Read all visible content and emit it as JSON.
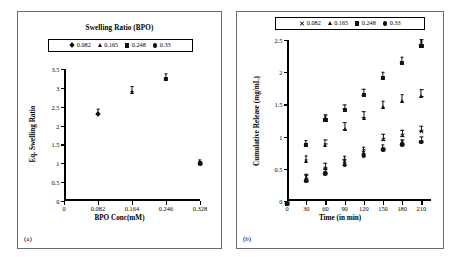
{
  "figure": {
    "background": "#ffffff",
    "marker_color": "#111111"
  },
  "panel_a": {
    "label": "(a)",
    "title": "Swelling Ratio (BPO)",
    "legend": [
      {
        "marker": "diamond",
        "label": "0.082"
      },
      {
        "marker": "triangle",
        "label": "0.165"
      },
      {
        "marker": "square",
        "label": "0.248"
      },
      {
        "marker": "circle",
        "label": "0.33"
      }
    ],
    "chart_data": {
      "type": "scatter",
      "title": "Swelling Ratio (BPO)",
      "xlabel": "BPO Conc(mM)",
      "ylabel": "Eq. Swelling Ratio",
      "xlim": [
        0,
        0.328
      ],
      "ylim": [
        0,
        3.5
      ],
      "grid": false,
      "legend_position": "top-center",
      "xticks": [
        "0",
        "0.082",
        "0.164",
        "0.246",
        "0.328"
      ],
      "xtick_values": [
        0,
        0.082,
        0.164,
        0.246,
        0.328
      ],
      "yticks": [
        "0",
        "0.5",
        "1",
        "1.5",
        "2",
        "2.5",
        "3",
        "3.5"
      ],
      "ytick_values": [
        0,
        0.5,
        1,
        1.5,
        2,
        2.5,
        3,
        3.5
      ],
      "series": [
        {
          "name": "0.082",
          "marker": "diamond",
          "points": [
            {
              "x": 0.082,
              "y": 2.38,
              "err": 0.06
            }
          ]
        },
        {
          "name": "0.165",
          "marker": "triangle",
          "points": [
            {
              "x": 0.164,
              "y": 2.97,
              "err": 0.08
            }
          ]
        },
        {
          "name": "0.248",
          "marker": "square",
          "points": [
            {
              "x": 0.246,
              "y": 3.32,
              "err": 0.07
            }
          ]
        },
        {
          "name": "0.33",
          "marker": "circle",
          "points": [
            {
              "x": 0.328,
              "y": 1.06,
              "err": 0.04
            }
          ]
        }
      ]
    }
  },
  "panel_b": {
    "label": "(b)",
    "legend": [
      {
        "marker": "cross",
        "label": "0.082"
      },
      {
        "marker": "triangle",
        "label": "0.165"
      },
      {
        "marker": "square",
        "label": "0.248"
      },
      {
        "marker": "circle",
        "label": "0.33"
      }
    ],
    "chart_data": {
      "type": "scatter",
      "title": "",
      "xlabel": "Time (in min)",
      "ylabel": "Cumulative Release (mg/mL)",
      "xlim": [
        0,
        225
      ],
      "ylim": [
        0,
        2.5
      ],
      "grid": false,
      "legend_position": "top-center",
      "xticks": [
        "0",
        "30",
        "60",
        "90",
        "120",
        "150",
        "180",
        "210"
      ],
      "xtick_values": [
        0,
        30,
        60,
        90,
        120,
        150,
        180,
        210
      ],
      "yticks": [
        "0",
        "0.5",
        "1",
        "1.5",
        "2",
        "2.5"
      ],
      "ytick_values": [
        0,
        0.5,
        1,
        1.5,
        2,
        2.5
      ],
      "x": [
        0,
        30,
        60,
        90,
        120,
        150,
        180,
        210
      ],
      "series": [
        {
          "name": "0.082",
          "marker": "cross",
          "values": [
            0.0,
            0.38,
            0.54,
            0.65,
            0.79,
            0.99,
            1.05,
            1.12
          ],
          "errors": [
            0.0,
            0.05,
            0.05,
            0.05,
            0.05,
            0.05,
            0.05,
            0.05
          ]
        },
        {
          "name": "0.165",
          "marker": "triangle",
          "values": [
            0.0,
            0.67,
            0.92,
            1.16,
            1.34,
            1.5,
            1.6,
            1.67
          ],
          "errors": [
            0.0,
            0.04,
            0.04,
            0.06,
            0.06,
            0.05,
            0.06,
            0.06
          ]
        },
        {
          "name": "0.248",
          "marker": "square",
          "values": [
            0.0,
            0.92,
            1.3,
            1.46,
            1.69,
            1.96,
            2.19,
            2.45
          ],
          "errors": [
            0.0,
            0.03,
            0.04,
            0.04,
            0.05,
            0.05,
            0.05,
            0.06
          ]
        },
        {
          "name": "0.33",
          "marker": "circle",
          "values": [
            0.0,
            0.35,
            0.47,
            0.6,
            0.75,
            0.84,
            0.92,
            0.96
          ],
          "errors": [
            0.0,
            0.05,
            0.05,
            0.05,
            0.06,
            0.04,
            0.04,
            0.04
          ]
        }
      ]
    }
  }
}
